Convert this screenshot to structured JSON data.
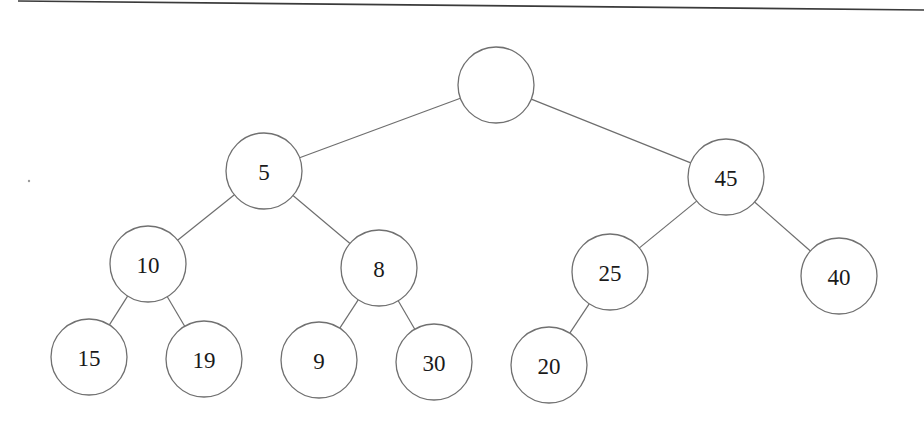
{
  "diagram": {
    "type": "binary-tree",
    "node_radius": 38,
    "colors": {
      "node_stroke": "#707070",
      "edge_stroke": "#6e6e6e",
      "label": "#1a1a1a",
      "background": "#ffffff",
      "top_rule": "#3a3a3a"
    },
    "nodes": [
      {
        "id": "root",
        "label": "",
        "cx": 496,
        "cy": 85
      },
      {
        "id": "n5",
        "label": "5",
        "cx": 264,
        "cy": 171
      },
      {
        "id": "n45",
        "label": "45",
        "cx": 726,
        "cy": 177
      },
      {
        "id": "n10",
        "label": "10",
        "cx": 148,
        "cy": 264
      },
      {
        "id": "n8",
        "label": "8",
        "cx": 379,
        "cy": 268
      },
      {
        "id": "n25",
        "label": "25",
        "cx": 610,
        "cy": 272
      },
      {
        "id": "n40",
        "label": "40",
        "cx": 839,
        "cy": 276
      },
      {
        "id": "n15",
        "label": "15",
        "cx": 89,
        "cy": 357
      },
      {
        "id": "n19",
        "label": "19",
        "cx": 204,
        "cy": 359
      },
      {
        "id": "n9",
        "label": "9",
        "cx": 319,
        "cy": 360
      },
      {
        "id": "n30",
        "label": "30",
        "cx": 434,
        "cy": 362
      },
      {
        "id": "n20",
        "label": "20",
        "cx": 549,
        "cy": 365
      }
    ],
    "edges": [
      {
        "from": "root",
        "to": "n5"
      },
      {
        "from": "root",
        "to": "n45"
      },
      {
        "from": "n5",
        "to": "n10"
      },
      {
        "from": "n5",
        "to": "n8"
      },
      {
        "from": "n45",
        "to": "n25"
      },
      {
        "from": "n45",
        "to": "n40"
      },
      {
        "from": "n10",
        "to": "n15"
      },
      {
        "from": "n10",
        "to": "n19"
      },
      {
        "from": "n8",
        "to": "n9"
      },
      {
        "from": "n8",
        "to": "n30"
      },
      {
        "from": "n25",
        "to": "n20"
      }
    ],
    "top_rule": {
      "x1": 18,
      "y1": 1,
      "x2": 924,
      "y2": 10
    }
  }
}
